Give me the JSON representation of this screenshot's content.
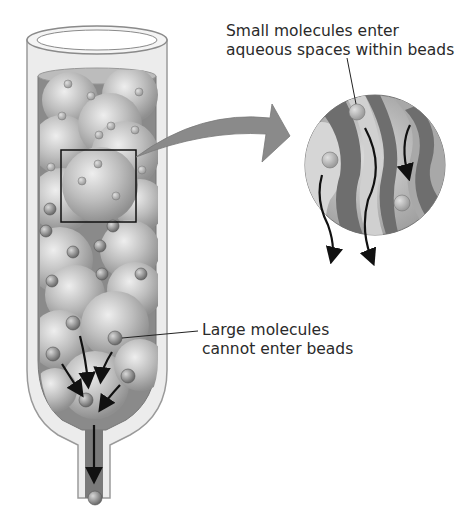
{
  "diagram": {
    "type": "gel-filtration-chromatography",
    "labels": {
      "small_molecules": {
        "line1": "Small molecules enter",
        "line2": "aqueous spaces within beads"
      },
      "large_molecules": {
        "line1": "Large molecules",
        "line2": "cannot enter beads"
      }
    },
    "components": [
      "column",
      "porous-beads",
      "magnified-bead-inset",
      "zoom-arrow",
      "small-molecules",
      "large-molecules",
      "flow-arrows",
      "outlet-tube",
      "eluted-molecule"
    ],
    "colors": {
      "column_glass": "#d9d9d9",
      "bead_fill": "#b5b5b5",
      "bead_highlight": "#e6e6e6",
      "channel_dark": "#6e6e6e",
      "arrow": "#111111",
      "text": "#2a2a2a"
    }
  }
}
